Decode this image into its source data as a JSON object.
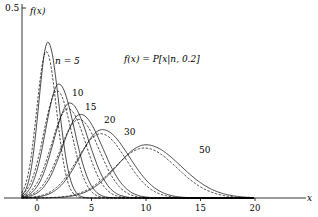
{
  "chart_data": {
    "type": "line",
    "title": "f(x) = P[x|n, 0.2]",
    "xlabel": "x",
    "ylabel": "f(x)",
    "xlim": [
      -1.5,
      20
    ],
    "ylim": [
      0,
      0.5
    ],
    "x_ticks": [
      "0",
      "5",
      "10",
      "15",
      "20"
    ],
    "x_tick_values": [
      0,
      5,
      10,
      15,
      20
    ],
    "y_ticks": [
      "0.5"
    ],
    "y_tick_values": [
      0.5
    ],
    "grid": false,
    "legend": "none",
    "p": 0.2,
    "series_style_note": "solid = smooth curve; dashed = comparison curve",
    "series": [
      {
        "name": "n = 5",
        "label": "n = 5",
        "n": 5,
        "mean": 1.0,
        "peak": 0.41
      },
      {
        "name": "n = 10",
        "label": "10",
        "n": 10,
        "mean": 2.0,
        "peak": 0.3
      },
      {
        "name": "n = 15",
        "label": "15",
        "n": 15,
        "mean": 3.0,
        "peak": 0.25
      },
      {
        "name": "n = 20",
        "label": "20",
        "n": 20,
        "mean": 4.0,
        "peak": 0.22
      },
      {
        "name": "n = 30",
        "label": "30",
        "n": 30,
        "mean": 6.0,
        "peak": 0.18
      },
      {
        "name": "n = 50",
        "label": "50",
        "n": 50,
        "mean": 10.0,
        "peak": 0.14
      }
    ],
    "annotations": [
      "n = 5",
      "10",
      "15",
      "20",
      "30",
      "50",
      "f(x) = P[x|n, 0.2]"
    ]
  },
  "labels": {
    "y_axis": "f(x)",
    "x_axis": "x",
    "formula": "f(x) = P[x|n, 0.2]",
    "y_tick": "0.5",
    "x_ticks": [
      "0",
      "5",
      "10",
      "15",
      "20"
    ],
    "curve_labels": [
      "n = 5",
      "10",
      "15",
      "20",
      "30",
      "50"
    ]
  }
}
